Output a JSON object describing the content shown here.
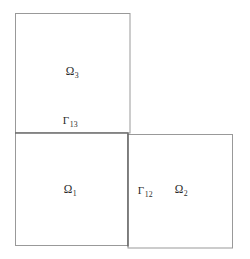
{
  "figure": {
    "type": "domain-decomposition-diagram",
    "background_color": "#ffffff",
    "outer_border_color": "#999999",
    "interface_line_color": "#555555",
    "label_color": "#2b2b2b",
    "subdomains": [
      {
        "id": "omega-1",
        "symbol": "Ω",
        "subscript": "1",
        "label": "Ω₁",
        "position": "bottom-left",
        "rect": {
          "x": 15,
          "y": 133,
          "width": 113,
          "height": 113
        },
        "label_point": {
          "x": 70,
          "y": 190
        }
      },
      {
        "id": "omega-2",
        "symbol": "Ω",
        "subscript": "2",
        "label": "Ω₂",
        "position": "bottom-right",
        "rect": {
          "x": 128,
          "y": 134,
          "width": 105,
          "height": 114
        },
        "label_point": {
          "x": 181,
          "y": 190
        }
      },
      {
        "id": "omega-3",
        "symbol": "Ω",
        "subscript": "3",
        "label": "Ω₃",
        "position": "top-left",
        "rect": {
          "x": 15,
          "y": 13,
          "width": 115,
          "height": 120
        },
        "label_point": {
          "x": 72,
          "y": 72
        }
      }
    ],
    "interfaces": [
      {
        "id": "gamma-12",
        "symbol": "Γ",
        "subscript": "12",
        "label": "Γ₁₂",
        "orientation": "vertical",
        "between": [
          "omega-1",
          "omega-2"
        ],
        "line": {
          "x1": 128,
          "y1": 134,
          "x2": 128,
          "y2": 246
        },
        "label_point": {
          "x": 145,
          "y": 190
        }
      },
      {
        "id": "gamma-13",
        "symbol": "Γ",
        "subscript": "13",
        "label": "Γ₁₃",
        "orientation": "horizontal",
        "between": [
          "omega-1",
          "omega-3"
        ],
        "line": {
          "x1": 15,
          "y1": 133,
          "x2": 128,
          "y2": 133
        },
        "label_point": {
          "x": 70,
          "y": 120
        }
      }
    ]
  }
}
